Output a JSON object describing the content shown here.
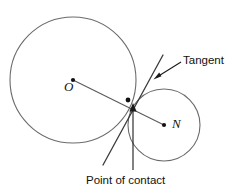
{
  "figure": {
    "type": "geometry-diagram",
    "background_color": "#ffffff",
    "stroke_color": "#6b6b6b",
    "ink_color": "#111111"
  },
  "labels": {
    "large_circle_center": "O",
    "small_circle_center": "N",
    "tangent": "Tangent",
    "point_of_contact": "Point of contact"
  },
  "geometry": {
    "large_circle": {
      "cx": 73,
      "cy": 80,
      "r": 63
    },
    "small_circle": {
      "cx": 164,
      "cy": 125,
      "r": 36
    },
    "contact_point": {
      "x": 128,
      "y": 100
    },
    "center_line": {
      "x1": 73,
      "y1": 80,
      "x2": 164,
      "y2": 125
    },
    "tangent_segment": {
      "x1": 163,
      "y1": 55,
      "x2": 103,
      "y2": 165
    },
    "tangent_leader": {
      "x1": 181,
      "y1": 62,
      "x2": 154,
      "y2": 79
    },
    "contact_leader": {
      "x1": 133,
      "y1": 170,
      "x2": 133,
      "y2": 104
    }
  }
}
